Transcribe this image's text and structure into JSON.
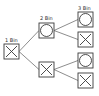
{
  "diagram": {
    "stroke_color": "#3a3a3a",
    "line_color": "#707070",
    "levels": [
      {
        "label": "1 Bin",
        "nodes": [
          {
            "id": "n1",
            "symbol": "cross"
          }
        ]
      },
      {
        "label": "2 Bin",
        "nodes": [
          {
            "id": "n2a",
            "symbol": "circle"
          },
          {
            "id": "n2b",
            "symbol": "cross"
          }
        ]
      },
      {
        "label": "3 Bin",
        "nodes": [
          {
            "id": "n3a",
            "symbol": "circle"
          },
          {
            "id": "n3b",
            "symbol": "cross"
          },
          {
            "id": "n3c",
            "symbol": "circle"
          },
          {
            "id": "n3d",
            "symbol": "cross"
          }
        ]
      }
    ],
    "edges": [
      [
        "n1",
        "n2a"
      ],
      [
        "n1",
        "n2b"
      ],
      [
        "n2a",
        "n3a"
      ],
      [
        "n2a",
        "n3b"
      ],
      [
        "n2b",
        "n3c"
      ],
      [
        "n2b",
        "n3d"
      ]
    ]
  }
}
